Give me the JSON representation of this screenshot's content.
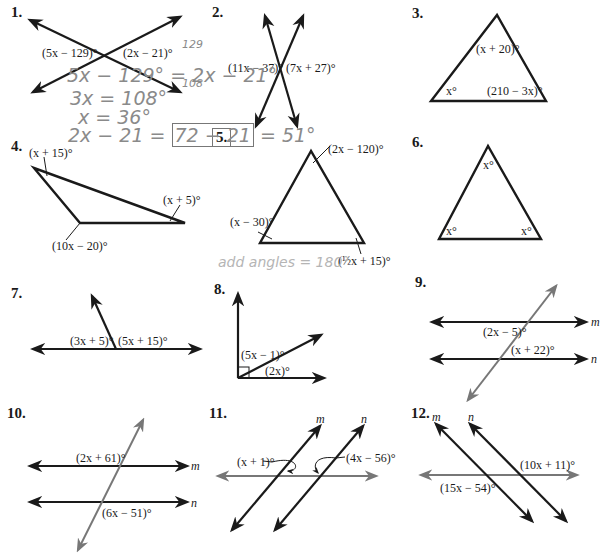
{
  "problems": [
    {
      "number": "1.",
      "type": "vertical-angles",
      "labels": [
        "(5x − 129)°",
        "(2x − 21)°"
      ]
    },
    {
      "number": "2.",
      "type": "vertical-angles",
      "labels": [
        "(11x − 37)°",
        "(7x + 27)°"
      ]
    },
    {
      "number": "3.",
      "type": "triangle",
      "labels": [
        "(x + 20)°",
        "x°",
        "(210 − 3x)°"
      ]
    },
    {
      "number": "4.",
      "type": "triangle",
      "labels": [
        "(x + 15)°",
        "(x + 5)°",
        "(10x − 20)°"
      ]
    },
    {
      "number": "5.",
      "type": "triangle",
      "labels": [
        "(2x − 120)°",
        "(x − 30)°",
        "(½x + 15)°"
      ]
    },
    {
      "number": "6.",
      "type": "triangle",
      "labels": [
        "x°",
        "x°",
        "x°"
      ]
    },
    {
      "number": "7.",
      "type": "linear-pair",
      "labels": [
        "(3x + 5)°",
        "(5x + 15)°"
      ]
    },
    {
      "number": "8.",
      "type": "complementary",
      "labels": [
        "(5x − 1)°",
        "(2x)°"
      ]
    },
    {
      "number": "9.",
      "type": "parallel-transversal",
      "labels": [
        "(2x − 5)°",
        "(x + 22)°"
      ],
      "lines": [
        "m",
        "n"
      ]
    },
    {
      "number": "10.",
      "type": "parallel-transversal",
      "labels": [
        "(2x + 61)°",
        "(6x − 51)°"
      ],
      "lines": [
        "m",
        "n"
      ]
    },
    {
      "number": "11.",
      "type": "parallel-transversal",
      "labels": [
        "(x + 1)°",
        "(4x − 56)°"
      ],
      "lines": [
        "m",
        "n"
      ]
    },
    {
      "number": "12.",
      "type": "parallel-transversal",
      "labels": [
        "(10x + 11)°",
        "(15x − 54)°"
      ],
      "lines": [
        "m",
        "n"
      ]
    }
  ],
  "handwriting": {
    "line1": "5x − 129° = 2x − 21°",
    "line2": "3x = 108°",
    "line3": "x = 36°",
    "line4_prefix": "2x − 21 =",
    "line4_boxed": "72 − 21",
    "line4_suffix": "= 51°",
    "margin_a": "129",
    "margin_b": "108",
    "note_p5": "add angles = 180°"
  },
  "colors": {
    "ink": "#1a1a1a",
    "transversal": "#777777",
    "pencil": "#8a8a8a"
  }
}
